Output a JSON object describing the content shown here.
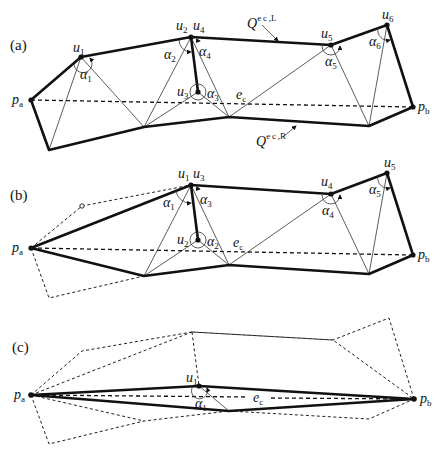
{
  "figure": {
    "panels": [
      {
        "id": "a",
        "label": "(a)",
        "endpoints": {
          "start": "p",
          "start_sub": "a",
          "end": "p",
          "end_sub": "b"
        },
        "vertices": [
          {
            "name": "u",
            "sub": "1"
          },
          {
            "name": "u",
            "sub": "2"
          },
          {
            "name": "u",
            "sub": "3"
          },
          {
            "name": "u",
            "sub": "4"
          },
          {
            "name": "u",
            "sub": "5"
          },
          {
            "name": "u",
            "sub": "6"
          }
        ],
        "angles": [
          {
            "name": "α",
            "sub": "1"
          },
          {
            "name": "α",
            "sub": "2"
          },
          {
            "name": "α",
            "sub": "3"
          },
          {
            "name": "α",
            "sub": "4"
          },
          {
            "name": "α",
            "sub": "5"
          },
          {
            "name": "α",
            "sub": "6"
          }
        ],
        "edge_label": {
          "name": "e",
          "sub": "c"
        },
        "chain_left": {
          "name": "Q",
          "sup": "e c ,L"
        },
        "chain_right": {
          "name": "Q",
          "sup": "e c ,R"
        }
      },
      {
        "id": "b",
        "label": "(b)",
        "endpoints": {
          "start": "p",
          "start_sub": "a",
          "end": "p",
          "end_sub": "b"
        },
        "vertices": [
          {
            "name": "u",
            "sub": "1"
          },
          {
            "name": "u",
            "sub": "2"
          },
          {
            "name": "u",
            "sub": "3"
          },
          {
            "name": "u",
            "sub": "4"
          },
          {
            "name": "u",
            "sub": "5"
          }
        ],
        "angles": [
          {
            "name": "α",
            "sub": "1"
          },
          {
            "name": "α",
            "sub": "2"
          },
          {
            "name": "α",
            "sub": "3"
          },
          {
            "name": "α",
            "sub": "4"
          },
          {
            "name": "α",
            "sub": "5"
          }
        ],
        "edge_label": {
          "name": "e",
          "sub": "c"
        }
      },
      {
        "id": "c",
        "label": "(c)",
        "endpoints": {
          "start": "p",
          "start_sub": "a",
          "end": "p",
          "end_sub": "b"
        },
        "vertices": [
          {
            "name": "u",
            "sub": "1"
          }
        ],
        "angles": [
          {
            "name": "α",
            "sub": "1"
          }
        ],
        "edge_label": {
          "name": "e",
          "sub": "c"
        }
      }
    ],
    "colors": {
      "ink": "#111111",
      "background": "#ffffff"
    }
  }
}
